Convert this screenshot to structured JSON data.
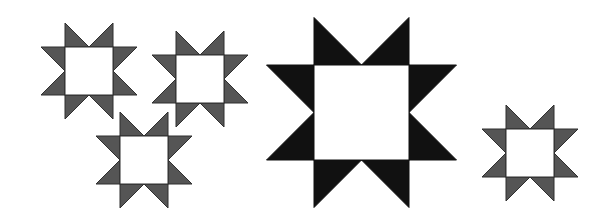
{
  "figure": {
    "background": "#ffffff",
    "stars": [
      {
        "id": "star-small-top-left",
        "x": 65,
        "y": 47,
        "size": 48,
        "fill": "#555555",
        "stroke": "#2f2f2f"
      },
      {
        "id": "star-small-top-middle",
        "x": 176,
        "y": 55,
        "size": 48,
        "fill": "#555555",
        "stroke": "#2f2f2f"
      },
      {
        "id": "star-small-bottom-middle",
        "x": 120,
        "y": 136,
        "size": 48,
        "fill": "#555555",
        "stroke": "#2f2f2f"
      },
      {
        "id": "star-large-center",
        "x": 314,
        "y": 65,
        "size": 95,
        "fill": "#111111",
        "stroke": "#111111"
      },
      {
        "id": "star-small-right",
        "x": 506,
        "y": 129,
        "size": 48,
        "fill": "#555555",
        "stroke": "#2f2f2f"
      }
    ],
    "center_fill": "#ffffff"
  }
}
